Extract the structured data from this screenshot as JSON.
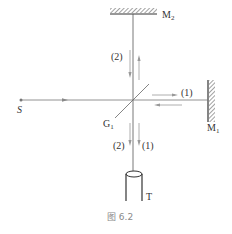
{
  "diagram": {
    "type": "michelson-interferometer",
    "labels": {
      "source": "S",
      "mirror_top": "M",
      "mirror_top_sub": "2",
      "mirror_right": "M",
      "mirror_right_sub": "1",
      "beam_splitter": "G",
      "beam_splitter_sub": "1",
      "telescope": "T",
      "beam1_right": "(1)",
      "beam2_up": "(2)",
      "beam2_out": "(2)",
      "beam1_out": "(1)"
    },
    "caption": "图 6.2",
    "colors": {
      "line": "#555555",
      "arrow": "#999999",
      "caption": "#8a8a8a"
    }
  }
}
